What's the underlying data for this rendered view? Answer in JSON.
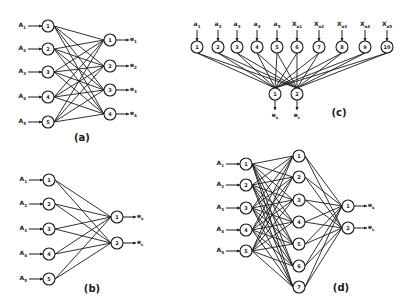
{
  "figure": {
    "panels": [
      {
        "id": "a",
        "label": "(a)",
        "label_pos": [
          82,
          141
        ],
        "type": "two-layer fully connected",
        "inputs": [
          {
            "name": "A",
            "sub": "1",
            "node": "1",
            "x": 48,
            "y": 26
          },
          {
            "name": "A",
            "sub": "2",
            "node": "2",
            "x": 48,
            "y": 49
          },
          {
            "name": "A",
            "sub": "3",
            "node": "3",
            "x": 48,
            "y": 72
          },
          {
            "name": "A",
            "sub": "4",
            "node": "4",
            "x": 48,
            "y": 97
          },
          {
            "name": "A",
            "sub": "5",
            "node": "5",
            "x": 48,
            "y": 122
          }
        ],
        "outputs": [
          {
            "name": "e",
            "sub": "1",
            "node": "1",
            "x": 110,
            "y": 40
          },
          {
            "name": "e",
            "sub": "2",
            "node": "2",
            "x": 110,
            "y": 66
          },
          {
            "name": "e",
            "sub": "3",
            "node": "3",
            "x": 110,
            "y": 90
          },
          {
            "name": "e",
            "sub": "4",
            "node": "4",
            "x": 110,
            "y": 114
          }
        ]
      },
      {
        "id": "b",
        "label": "(b)",
        "label_pos": [
          92,
          292
        ],
        "type": "two-layer fully connected",
        "inputs": [
          {
            "name": "A",
            "sub": "1",
            "node": "1",
            "x": 49,
            "y": 180
          },
          {
            "name": "A",
            "sub": "2",
            "node": "2",
            "x": 49,
            "y": 204
          },
          {
            "name": "A",
            "sub": "3",
            "node": "3",
            "x": 49,
            "y": 229
          },
          {
            "name": "A",
            "sub": "4",
            "node": "4",
            "x": 49,
            "y": 254
          },
          {
            "name": "A",
            "sub": "5",
            "node": "5",
            "x": 49,
            "y": 279
          }
        ],
        "outputs": [
          {
            "name": "e",
            "sub": "s",
            "node": "1",
            "x": 117,
            "y": 217
          },
          {
            "name": "e",
            "sub": "c",
            "node": "2",
            "x": 117,
            "y": 243
          }
        ]
      },
      {
        "id": "c",
        "label": "(c)",
        "label_pos": [
          339,
          116
        ],
        "type": "two-layer fully connected (vertical)",
        "inputs": [
          {
            "name": "a",
            "sub": "1",
            "node": "1",
            "x": 197,
            "y": 47
          },
          {
            "name": "a",
            "sub": "2",
            "node": "2",
            "x": 218,
            "y": 47
          },
          {
            "name": "a",
            "sub": "3",
            "node": "3",
            "x": 237,
            "y": 47
          },
          {
            "name": "a",
            "sub": "4",
            "node": "4",
            "x": 257,
            "y": 47
          },
          {
            "name": "a",
            "sub": "5",
            "node": "5",
            "x": 277,
            "y": 47
          },
          {
            "name": "X",
            "sub": "a1",
            "node": "6",
            "x": 297,
            "y": 47
          },
          {
            "name": "X",
            "sub": "a2",
            "node": "7",
            "x": 319,
            "y": 47
          },
          {
            "name": "X",
            "sub": "a3",
            "node": "8",
            "x": 342,
            "y": 47
          },
          {
            "name": "X",
            "sub": "a4",
            "node": "9",
            "x": 365,
            "y": 47
          },
          {
            "name": "X",
            "sub": "a5",
            "node": "10",
            "x": 387,
            "y": 47
          }
        ],
        "outputs": [
          {
            "name": "e",
            "sub": "s",
            "node": "1",
            "x": 275,
            "y": 94
          },
          {
            "name": "e",
            "sub": "c",
            "node": "2",
            "x": 297,
            "y": 94
          }
        ]
      },
      {
        "id": "d",
        "label": "(d)",
        "label_pos": [
          341,
          291
        ],
        "type": "three-layer fully connected",
        "inputs": [
          {
            "name": "A",
            "sub": "1",
            "node": "1",
            "x": 246,
            "y": 164
          },
          {
            "name": "A",
            "sub": "2",
            "node": "2",
            "x": 246,
            "y": 185
          },
          {
            "name": "A",
            "sub": "3",
            "node": "3",
            "x": 246,
            "y": 208
          },
          {
            "name": "A",
            "sub": "4",
            "node": "4",
            "x": 246,
            "y": 230
          },
          {
            "name": "A",
            "sub": "5",
            "node": "5",
            "x": 246,
            "y": 251
          }
        ],
        "hidden": [
          {
            "node": "1",
            "x": 299,
            "y": 156
          },
          {
            "node": "2",
            "x": 299,
            "y": 177
          },
          {
            "node": "3",
            "x": 299,
            "y": 200
          },
          {
            "node": "4",
            "x": 299,
            "y": 222
          },
          {
            "node": "5",
            "x": 299,
            "y": 244
          },
          {
            "node": "6",
            "x": 299,
            "y": 266
          },
          {
            "node": "7",
            "x": 299,
            "y": 287
          }
        ],
        "outputs": [
          {
            "name": "e",
            "sub": "s",
            "node": "1",
            "x": 348,
            "y": 206
          },
          {
            "name": "e",
            "sub": "c",
            "node": "2",
            "x": 348,
            "y": 228
          }
        ]
      }
    ],
    "colors": {
      "ink": "#1a1a1a",
      "background": "#ffffff"
    }
  }
}
